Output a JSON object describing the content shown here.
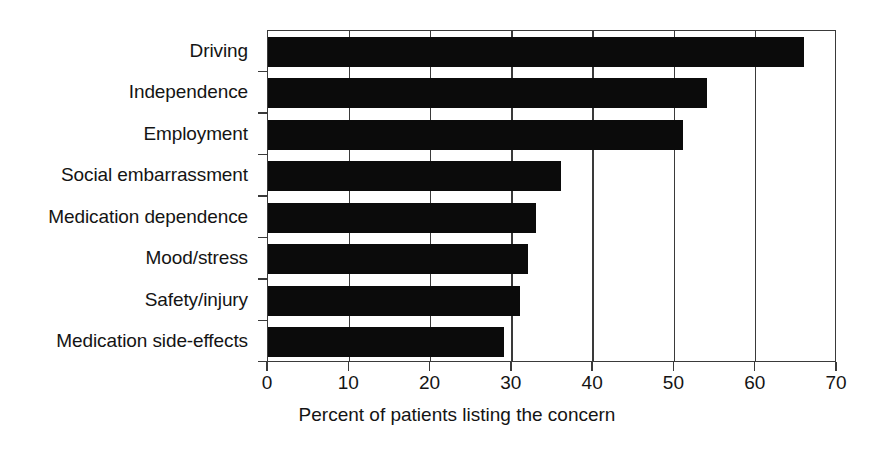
{
  "chart_data": {
    "type": "bar",
    "orientation": "horizontal",
    "title": "",
    "subtitle": "",
    "xlabel": "Percent of patients listing the concern",
    "ylabel": "",
    "categories": [
      "Driving",
      "Independence",
      "Employment",
      "Social embarrassment",
      "Medication dependence",
      "Mood/stress",
      "Safety/injury",
      "Medication side-effects"
    ],
    "values": [
      66,
      54,
      51,
      36,
      33,
      32,
      31,
      29
    ],
    "xlim": [
      0,
      70
    ],
    "xticks": [
      0,
      10,
      20,
      30,
      40,
      50,
      60,
      70
    ],
    "xtick_labels": [
      "0",
      "10",
      "20",
      "30",
      "40",
      "50",
      "60",
      "70"
    ],
    "grid": "vertical",
    "legend": "none",
    "bar_color": "#0b0b0b",
    "axis_color": "#3a3a3a",
    "background_color": "#ffffff"
  },
  "figure": {
    "axis_title": "Percent of patients listing the concern"
  }
}
